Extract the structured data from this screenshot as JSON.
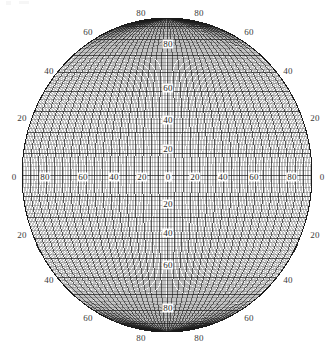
{
  "figure": {
    "kind": "map-projection-graticule",
    "background_color": "#ffffff",
    "line_color": "#1a1a1a",
    "label_color": "#2b2b2b"
  },
  "chart_data": {
    "type": "scatter",
    "title": "",
    "xlabel": "",
    "ylabel": "",
    "projection": "elliptical pseudocylindrical world projection",
    "graticule": {
      "fine_interval_deg": 2,
      "major_interval_deg": 10,
      "labeled_interval_deg": 20,
      "longitude_range": [
        -180,
        180
      ],
      "latitude_range": [
        -90,
        90
      ]
    },
    "ellipse": {
      "center_x_px": 167,
      "center_y_px": 175,
      "semi_axis_x_px": 145,
      "semi_axis_y_px": 157
    },
    "labels_outer_top": [
      "80",
      "80"
    ],
    "labels_outer_bottom": [
      "80",
      "80"
    ],
    "labels_outer_left": [
      "60",
      "40",
      "20",
      "0",
      "20",
      "40",
      "60"
    ],
    "labels_outer_right": [
      "60",
      "40",
      "20",
      "0",
      "20",
      "40",
      "60"
    ],
    "labels_equator_inner": [
      "80",
      "60",
      "40",
      "20",
      "0",
      "20",
      "40",
      "60",
      "80"
    ],
    "labels_meridian_inner": [
      "80",
      "60",
      "40",
      "20",
      "0",
      "20",
      "40",
      "60",
      "80"
    ]
  },
  "labels": {
    "outer": [
      {
        "text": "80",
        "x": 141,
        "y": 13,
        "name": "outer-label-lat-80-top-left"
      },
      {
        "text": "80",
        "x": 199,
        "y": 13,
        "name": "outer-label-lat-80-top-right"
      },
      {
        "text": "60",
        "x": 88,
        "y": 32,
        "name": "outer-label-lat-60-top-left"
      },
      {
        "text": "60",
        "x": 249,
        "y": 32,
        "name": "outer-label-lat-60-top-right"
      },
      {
        "text": "40",
        "x": 49,
        "y": 71,
        "name": "outer-label-lat-40-top-left"
      },
      {
        "text": "40",
        "x": 288,
        "y": 71,
        "name": "outer-label-lat-40-top-right"
      },
      {
        "text": "20",
        "x": 22,
        "y": 118,
        "name": "outer-label-lat-20-top-left"
      },
      {
        "text": "20",
        "x": 315,
        "y": 118,
        "name": "outer-label-lat-20-top-right"
      },
      {
        "text": "0",
        "x": 14,
        "y": 177,
        "name": "outer-label-lat-0-left"
      },
      {
        "text": "0",
        "x": 322,
        "y": 177,
        "name": "outer-label-lat-0-right"
      },
      {
        "text": "20",
        "x": 22,
        "y": 235,
        "name": "outer-label-lat-20-bottom-left"
      },
      {
        "text": "20",
        "x": 315,
        "y": 235,
        "name": "outer-label-lat-20-bottom-right"
      },
      {
        "text": "40",
        "x": 49,
        "y": 280,
        "name": "outer-label-lat-40-bottom-left"
      },
      {
        "text": "40",
        "x": 288,
        "y": 280,
        "name": "outer-label-lat-40-bottom-right"
      },
      {
        "text": "60",
        "x": 88,
        "y": 318,
        "name": "outer-label-lat-60-bottom-left"
      },
      {
        "text": "60",
        "x": 249,
        "y": 318,
        "name": "outer-label-lat-60-bottom-right"
      },
      {
        "text": "80",
        "x": 141,
        "y": 338,
        "name": "outer-label-lat-80-bottom-left"
      },
      {
        "text": "80",
        "x": 199,
        "y": 338,
        "name": "outer-label-lat-80-bottom-right"
      }
    ],
    "equator": [
      {
        "text": "80",
        "x": 45,
        "y": 177,
        "name": "equator-label-lon-80-west"
      },
      {
        "text": "60",
        "x": 83,
        "y": 177,
        "name": "equator-label-lon-60-west"
      },
      {
        "text": "40",
        "x": 114,
        "y": 177,
        "name": "equator-label-lon-40-west"
      },
      {
        "text": "20",
        "x": 142,
        "y": 177,
        "name": "equator-label-lon-20-west"
      },
      {
        "text": "0",
        "x": 168,
        "y": 177,
        "name": "equator-label-lon-0"
      },
      {
        "text": "20",
        "x": 195,
        "y": 177,
        "name": "equator-label-lon-20-east"
      },
      {
        "text": "40",
        "x": 223,
        "y": 177,
        "name": "equator-label-lon-40-east"
      },
      {
        "text": "60",
        "x": 254,
        "y": 177,
        "name": "equator-label-lon-60-east"
      },
      {
        "text": "80",
        "x": 292,
        "y": 177,
        "name": "equator-label-lon-80-east"
      }
    ],
    "meridian": [
      {
        "text": "80",
        "x": 168,
        "y": 44,
        "name": "meridian-label-lat-80-north"
      },
      {
        "text": "60",
        "x": 168,
        "y": 88,
        "name": "meridian-label-lat-60-north"
      },
      {
        "text": "40",
        "x": 168,
        "y": 120,
        "name": "meridian-label-lat-40-north"
      },
      {
        "text": "20",
        "x": 168,
        "y": 149,
        "name": "meridian-label-lat-20-north"
      },
      {
        "text": "0",
        "x": 168,
        "y": 177,
        "name": "meridian-label-lat-0"
      },
      {
        "text": "20",
        "x": 168,
        "y": 204,
        "name": "meridian-label-lat-20-south"
      },
      {
        "text": "40",
        "x": 168,
        "y": 233,
        "name": "meridian-label-lat-40-south"
      },
      {
        "text": "60",
        "x": 168,
        "y": 265,
        "name": "meridian-label-lat-60-south"
      },
      {
        "text": "80",
        "x": 168,
        "y": 308,
        "name": "meridian-label-lat-80-south"
      }
    ]
  }
}
